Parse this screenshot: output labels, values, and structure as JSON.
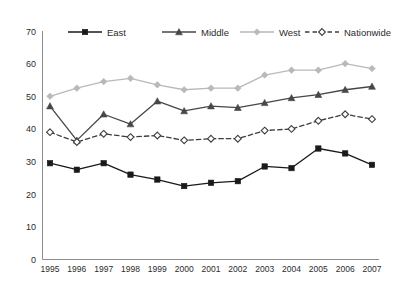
{
  "chart_data": {
    "type": "line",
    "title": "",
    "xlabel": "",
    "ylabel": "",
    "categories": [
      "1995",
      "1996",
      "1997",
      "1998",
      "1999",
      "2000",
      "2001",
      "2002",
      "2003",
      "2004",
      "2005",
      "2006",
      "2007"
    ],
    "x": [
      1995,
      1996,
      1997,
      1998,
      1999,
      2000,
      2001,
      2002,
      2003,
      2004,
      2005,
      2006,
      2007
    ],
    "ylim": [
      0,
      70
    ],
    "yticks": [
      0,
      10,
      20,
      30,
      40,
      50,
      60,
      70
    ],
    "grid": false,
    "legend_position": "top",
    "series": [
      {
        "name": "East",
        "color": "#1a1a1a",
        "marker": "square",
        "dash": "solid",
        "values": [
          29.5,
          27.5,
          29.5,
          26.0,
          24.5,
          22.5,
          23.5,
          24.0,
          28.5,
          28.0,
          34.0,
          32.5,
          29.0
        ]
      },
      {
        "name": "Middle",
        "color": "#474747",
        "marker": "triangle",
        "dash": "solid",
        "values": [
          47.0,
          36.5,
          44.5,
          41.5,
          48.5,
          45.5,
          47.0,
          46.5,
          48.0,
          49.5,
          50.5,
          52.0,
          53.0
        ]
      },
      {
        "name": "West",
        "color": "#b9b9b9",
        "marker": "diamond",
        "dash": "solid",
        "values": [
          50.0,
          52.5,
          54.5,
          55.5,
          53.5,
          52.0,
          52.5,
          52.5,
          56.5,
          58.0,
          58.0,
          60.0,
          58.5
        ]
      },
      {
        "name": "Nationwide",
        "color": "#3d3d3d",
        "marker": "open-diamond",
        "dash": "dashed",
        "values": [
          39.0,
          36.0,
          38.5,
          37.5,
          38.0,
          36.5,
          37.0,
          37.0,
          39.5,
          40.0,
          42.5,
          44.5,
          43.0
        ]
      }
    ]
  },
  "legend": {
    "items": [
      {
        "label": "East"
      },
      {
        "label": "Middle"
      },
      {
        "label": "West"
      },
      {
        "label": "Nationwide"
      }
    ]
  }
}
